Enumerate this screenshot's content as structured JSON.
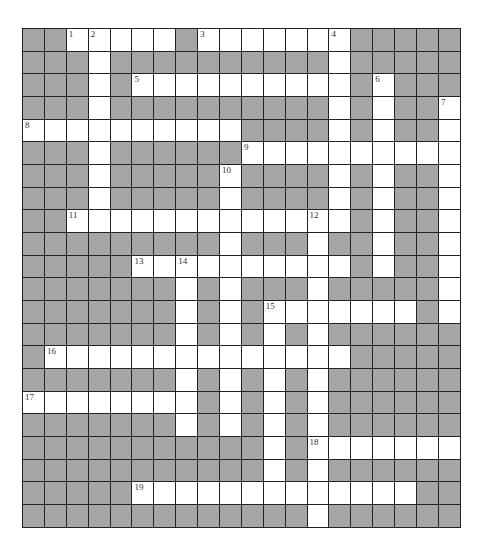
{
  "puzzle": {
    "cols": 20,
    "rows": 22,
    "colors": {
      "block": "#a6a6a6",
      "open": "#ffffff",
      "line": "#222222"
    },
    "grid": [
      "00111110111111100000",
      "00010000000000100000",
      "00010111111111101000",
      "00010000000000101001",
      "11111111110000101001",
      "00010000001111111111",
      "00010000010000101001",
      "00010000010000101001",
      "00111111111111101001",
      "00000000010001001001",
      "00000111111111101001",
      "00000001010001000001",
      "00000001010111111101",
      "00000001010101000000",
      "01111111111111100000",
      "00000001010101000000",
      "11111111010101000000",
      "00000001010101000000",
      "00000000000101111111",
      "00000000000101000000",
      "00000111111111111100",
      "00000000000001000000"
    ],
    "numbers": [
      {
        "n": "1",
        "r": 0,
        "c": 2
      },
      {
        "n": "2",
        "r": 0,
        "c": 3
      },
      {
        "n": "3",
        "r": 0,
        "c": 8
      },
      {
        "n": "4",
        "r": 0,
        "c": 14
      },
      {
        "n": "5",
        "r": 2,
        "c": 5
      },
      {
        "n": "6",
        "r": 2,
        "c": 16
      },
      {
        "n": "7",
        "r": 3,
        "c": 19
      },
      {
        "n": "8",
        "r": 4,
        "c": 0
      },
      {
        "n": "9",
        "r": 5,
        "c": 10
      },
      {
        "n": "10",
        "r": 6,
        "c": 9
      },
      {
        "n": "11",
        "r": 8,
        "c": 2
      },
      {
        "n": "12",
        "r": 8,
        "c": 13
      },
      {
        "n": "13",
        "r": 10,
        "c": 5
      },
      {
        "n": "14",
        "r": 10,
        "c": 7
      },
      {
        "n": "15",
        "r": 12,
        "c": 11
      },
      {
        "n": "16",
        "r": 14,
        "c": 1
      },
      {
        "n": "17",
        "r": 16,
        "c": 0
      },
      {
        "n": "18",
        "r": 18,
        "c": 13
      },
      {
        "n": "19",
        "r": 20,
        "c": 5
      }
    ]
  }
}
